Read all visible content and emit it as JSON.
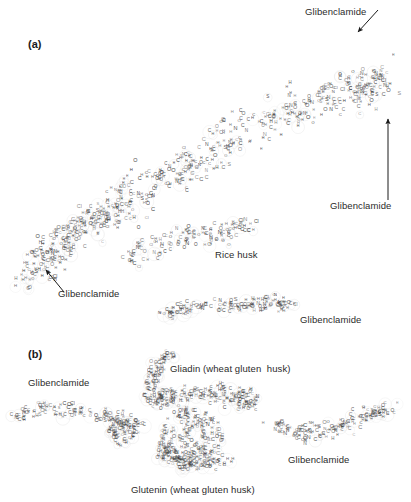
{
  "figure": {
    "width": 411,
    "height": 502,
    "background": "#ffffff",
    "atom_color": "#3a3a3a",
    "halo_color": "#d8d8d8",
    "text_color": "#2b2b2b"
  },
  "panels": [
    {
      "id": "a",
      "label": "(a)",
      "x": 28,
      "y": 38
    },
    {
      "id": "b",
      "label": "(b)",
      "x": 28,
      "y": 348
    }
  ],
  "callouts": [
    {
      "id": "glib-top-right",
      "label": "Glibenclamide",
      "x": 305,
      "y": 6,
      "align": "left"
    },
    {
      "id": "glib-right",
      "label": "Glibenclamide",
      "x": 330,
      "y": 200,
      "align": "left"
    },
    {
      "id": "glib-left",
      "label": "Glibenclamide",
      "x": 58,
      "y": 288,
      "align": "left"
    },
    {
      "id": "glib-mid-right",
      "label": "Glibenclamide",
      "x": 300,
      "y": 314,
      "align": "left"
    },
    {
      "id": "glib-b-left",
      "label": "Glibenclamide",
      "x": 28,
      "y": 377,
      "align": "left"
    },
    {
      "id": "glib-b-right",
      "label": "Glibenclamide",
      "x": 288,
      "y": 454,
      "align": "left"
    }
  ],
  "structure_labels": [
    {
      "id": "rice-husk",
      "label": "Rice husk",
      "x": 215,
      "y": 249
    },
    {
      "id": "gliadin",
      "label": "Gliadin (wheat gluten  husk)",
      "x": 170,
      "y": 363
    },
    {
      "id": "glutenin",
      "label": "Glutenin (wheat gluten husk)",
      "x": 131,
      "y": 484
    }
  ],
  "arrows": [
    {
      "id": "arrow-top-right",
      "x1": 378,
      "y1": 10,
      "x2": 358,
      "y2": 32,
      "head": "end"
    },
    {
      "id": "arrow-right-up",
      "x1": 388,
      "y1": 200,
      "x2": 388,
      "y2": 119,
      "head": "end"
    },
    {
      "id": "arrow-left-up",
      "x1": 64,
      "y1": 292,
      "x2": 46,
      "y2": 270,
      "head": "end"
    }
  ],
  "chart_data": {
    "type": "scatter",
    "atom_types": [
      "C",
      "H",
      "O",
      "N",
      "S",
      "Cl"
    ],
    "atom_weights": [
      0.36,
      0.42,
      0.12,
      0.06,
      0.02,
      0.02
    ],
    "clusters": [
      {
        "name": "rice-husk-main",
        "panel": "a",
        "atoms": 520,
        "shape": "band",
        "points": [
          [
            40,
            268
          ],
          [
            70,
            240
          ],
          [
            110,
            210
          ],
          [
            150,
            185
          ],
          [
            195,
            160
          ],
          [
            240,
            135
          ],
          [
            285,
            115
          ],
          [
            325,
            100
          ],
          [
            360,
            88
          ],
          [
            385,
            80
          ]
        ],
        "thickness": 62,
        "seed": 1771
      },
      {
        "name": "rice-husk-tail-left",
        "panel": "a",
        "atoms": 90,
        "shape": "band",
        "points": [
          [
            18,
            290
          ],
          [
            40,
            262
          ],
          [
            62,
            238
          ],
          [
            88,
            222
          ],
          [
            112,
            212
          ]
        ],
        "thickness": 34,
        "seed": 2291
      },
      {
        "name": "rice-husk-lower-lobe",
        "panel": "a",
        "atoms": 120,
        "shape": "band",
        "points": [
          [
            120,
            262
          ],
          [
            155,
            250
          ],
          [
            190,
            238
          ],
          [
            225,
            232
          ],
          [
            258,
            228
          ]
        ],
        "thickness": 34,
        "seed": 3313
      },
      {
        "name": "glibenclamide-strand-mid",
        "panel": "a",
        "atoms": 130,
        "shape": "band",
        "points": [
          [
            163,
            315
          ],
          [
            200,
            308
          ],
          [
            240,
            305
          ],
          [
            275,
            304
          ],
          [
            292,
            308
          ]
        ],
        "thickness": 22,
        "seed": 4409
      },
      {
        "name": "glibenclamide-b-left",
        "panel": "b",
        "atoms": 125,
        "shape": "band",
        "points": [
          [
            16,
            418
          ],
          [
            48,
            410
          ],
          [
            85,
            412
          ],
          [
            118,
            420
          ],
          [
            140,
            432
          ]
        ],
        "thickness": 24,
        "seed": 5519
      },
      {
        "name": "glibenclamide-b-left-knot",
        "panel": "b",
        "atoms": 55,
        "shape": "blob",
        "points": [
          [
            122,
            434
          ]
        ],
        "thickness": 28,
        "seed": 6073
      },
      {
        "name": "gliadin-upper-arm",
        "panel": "b",
        "atoms": 70,
        "shape": "band",
        "points": [
          [
            147,
            395
          ],
          [
            152,
            378
          ],
          [
            160,
            364
          ],
          [
            170,
            356
          ]
        ],
        "thickness": 22,
        "seed": 7129
      },
      {
        "name": "gliadin-core",
        "panel": "b",
        "atoms": 190,
        "shape": "band",
        "points": [
          [
            150,
            402
          ],
          [
            175,
            398
          ],
          [
            205,
            396
          ],
          [
            232,
            398
          ],
          [
            252,
            404
          ]
        ],
        "thickness": 30,
        "seed": 8231
      },
      {
        "name": "glutenin-core",
        "panel": "b",
        "atoms": 210,
        "shape": "blob",
        "points": [
          [
            190,
            440
          ]
        ],
        "thickness": 66,
        "seed": 9337
      },
      {
        "name": "glutenin-lower",
        "panel": "b",
        "atoms": 90,
        "shape": "band",
        "points": [
          [
            160,
            452
          ],
          [
            180,
            462
          ],
          [
            205,
            468
          ],
          [
            228,
            462
          ]
        ],
        "thickness": 26,
        "seed": 10427
      },
      {
        "name": "glibenclamide-b-right",
        "panel": "b",
        "atoms": 150,
        "shape": "band",
        "points": [
          [
            268,
            425
          ],
          [
            300,
            435
          ],
          [
            330,
            432
          ],
          [
            360,
            418
          ],
          [
            392,
            408
          ]
        ],
        "thickness": 26,
        "seed": 11519
      }
    ]
  }
}
